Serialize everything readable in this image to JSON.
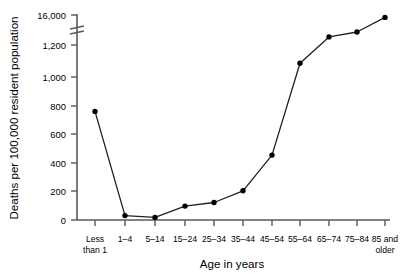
{
  "chart_data": {
    "type": "line",
    "title": "",
    "xlabel": "Age in years",
    "ylabel": "Deaths per 100,000 resident population",
    "categories": [
      "Less than 1",
      "1–4",
      "5–14",
      "15–24",
      "25–34",
      "35–44",
      "45–54",
      "55–64",
      "65–74",
      "75–84",
      "85 and older"
    ],
    "category_lines": [
      [
        "Less",
        "than 1"
      ],
      [
        "1–4",
        ""
      ],
      [
        "5–14",
        ""
      ],
      [
        "15–24",
        ""
      ],
      [
        "25–34",
        ""
      ],
      [
        "35–44",
        ""
      ],
      [
        "45–54",
        ""
      ],
      [
        "55–64",
        ""
      ],
      [
        "65–74",
        ""
      ],
      [
        "75–84",
        ""
      ],
      [
        "85 and",
        "older"
      ]
    ],
    "values": [
      745,
      30,
      18,
      95,
      120,
      200,
      445,
      1075,
      5200,
      7600,
      14800
    ],
    "ytick_labels": [
      "0",
      "200",
      "400",
      "600",
      "800",
      "1,000",
      "1,200",
      "16,000"
    ],
    "ytick_values": [
      0,
      200,
      400,
      600,
      800,
      1000,
      1200,
      16000
    ],
    "ylim": [
      0,
      16000
    ],
    "axis_break": true,
    "axis_break_between": [
      1200,
      16000
    ],
    "grid": false,
    "legend": "none",
    "series_color": "#000000"
  },
  "labels": {
    "y_axis_title": "Deaths per 100,000 resident population",
    "x_axis_title": "Age in years",
    "y0": "0",
    "y200": "200",
    "y400": "400",
    "y600": "600",
    "y800": "800",
    "y1000": "1,000",
    "y1200": "1,200",
    "y16000": "16,000",
    "x0a": "Less",
    "x0b": "than 1",
    "x1": "1–4",
    "x2": "5–14",
    "x3": "15–24",
    "x4": "25–34",
    "x5": "35–44",
    "x6": "45–54",
    "x7": "55–64",
    "x8": "65–74",
    "x9": "75–84",
    "x10a": "85 and",
    "x10b": "older"
  }
}
